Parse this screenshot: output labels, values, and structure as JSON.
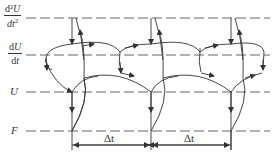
{
  "diagram": {
    "rows": [
      {
        "id": "d2U",
        "label_num": "d²",
        "label_num_var": "U",
        "label_den": "dt",
        "label_den_sup": "2",
        "y": 18
      },
      {
        "id": "dU",
        "label_num": "d",
        "label_num_var": "U",
        "label_den": "dt",
        "y": 55
      },
      {
        "id": "U",
        "label": "U",
        "y": 92
      },
      {
        "id": "F",
        "label": "F",
        "y": 131
      }
    ],
    "time_steps": [
      72,
      151,
      231
    ],
    "interval_label": "Δt",
    "intervals": [
      {
        "label": "Δt",
        "from": 72,
        "to": 151
      },
      {
        "label": "Δt",
        "from": 151,
        "to": 231
      }
    ],
    "colors": {
      "line": "#333333",
      "dash": "#555555"
    }
  }
}
